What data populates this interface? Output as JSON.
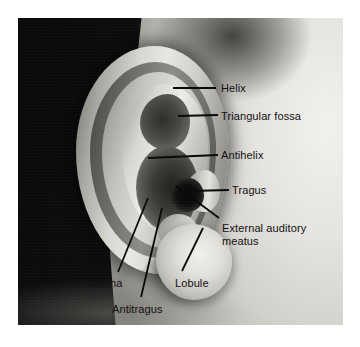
{
  "figure": {
    "kind": "labeled-anatomical-photograph",
    "background_color": "#ffffff",
    "label_text_color": "#111111",
    "leader_line_color": "#0a0a0a",
    "photo": {
      "x": 18,
      "y": 18,
      "width": 325,
      "height": 307,
      "tone": "grayscale",
      "regions": [
        {
          "name": "dark-hair-field",
          "description": "dark hair and scalp filling the left portion"
        },
        {
          "name": "skin-field",
          "description": "bright skin of temple and cheek at right"
        },
        {
          "name": "auricle",
          "description": "the ear, centered"
        }
      ]
    }
  },
  "labels": [
    {
      "id": "helix",
      "text": "Helix",
      "text_x": 221,
      "text_y": 82,
      "leader": {
        "x1": 173,
        "y1": 88,
        "x2": 216,
        "y2": 88,
        "type": "straight"
      }
    },
    {
      "id": "triangular-fossa",
      "text": "Triangular fossa",
      "text_x": 221,
      "text_y": 110,
      "leader": {
        "x1": 178,
        "y1": 116,
        "x2": 218,
        "y2": 115,
        "type": "straight"
      }
    },
    {
      "id": "antihelix",
      "text": "Antihelix",
      "text_x": 221,
      "text_y": 149,
      "leader": {
        "x1": 148,
        "y1": 158,
        "x2": 218,
        "y2": 155,
        "type": "straight"
      }
    },
    {
      "id": "tragus",
      "text": "Tragus",
      "text_x": 232,
      "text_y": 184,
      "leader": {
        "x1": 190,
        "y1": 191,
        "x2": 229,
        "y2": 190,
        "type": "straight"
      }
    },
    {
      "id": "external-auditory-meatus",
      "text": "External auditory\nmeatus",
      "line1": "External auditory",
      "line2": "meatus",
      "text_x": 222,
      "text_y": 222,
      "leader": {
        "x1": 176,
        "y1": 186,
        "x2": 219,
        "y2": 218,
        "type": "diagonal"
      }
    },
    {
      "id": "concha",
      "text": "Concha",
      "text_x": 84,
      "text_y": 277,
      "leader": {
        "x1": 148,
        "y1": 198,
        "x2": 118,
        "y2": 272,
        "type": "diagonal"
      }
    },
    {
      "id": "antitragus",
      "text": "Antitragus",
      "text_x": 112,
      "text_y": 303,
      "leader": {
        "x1": 162,
        "y1": 208,
        "x2": 141,
        "y2": 297,
        "type": "diagonal"
      }
    },
    {
      "id": "lobule",
      "text": "Lobule",
      "text_x": 175,
      "text_y": 277,
      "leader": {
        "x1": 203,
        "y1": 228,
        "x2": 182,
        "y2": 271,
        "type": "diagonal"
      }
    }
  ]
}
